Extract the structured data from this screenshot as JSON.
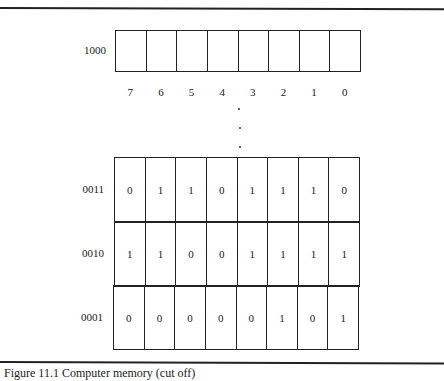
{
  "diagram": {
    "type": "memory-layout",
    "top_location": {
      "address": "1000",
      "bits": [
        "",
        "",
        "",
        "",
        "",
        "",
        "",
        ""
      ]
    },
    "bit_positions": [
      "7",
      "6",
      "5",
      "4",
      "3",
      "2",
      "1",
      "0"
    ],
    "ellipsis": "⋮",
    "locations": [
      {
        "address": "0011",
        "bits": [
          "0",
          "1",
          "1",
          "0",
          "1",
          "1",
          "1",
          "0"
        ]
      },
      {
        "address": "0010",
        "bits": [
          "1",
          "1",
          "0",
          "0",
          "1",
          "1",
          "1",
          "1"
        ]
      },
      {
        "address": "0001",
        "bits": [
          "0",
          "0",
          "0",
          "0",
          "0",
          "1",
          "0",
          "1"
        ]
      }
    ],
    "caption_partial": "Figure 11.1 Computer memory (cut off)"
  }
}
